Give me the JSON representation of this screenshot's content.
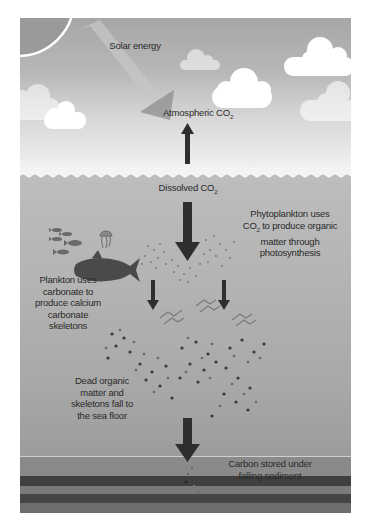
{
  "diagram": {
    "palette": {
      "sky_top": "#a6a6a6",
      "sky_bottom": "#f4f4f4",
      "sea": "#b3b3b3",
      "arrow": "#2e2e2e",
      "cloud": "#ffffff",
      "sediment_dark": "#3c3c3c"
    },
    "labels": {
      "solar_energy": "Solar energy",
      "atmospheric_co2": "Atmospheric CO",
      "atmospheric_co2_sub": "2",
      "dissolved_co2": "Dissolved CO",
      "dissolved_co2_sub": "2",
      "phyto_line1": "Phytoplankton uses",
      "phyto_line2a": "CO",
      "phyto_line2_sub": "2",
      "phyto_line2b": " to produce organic",
      "phyto_line3": "matter through",
      "phyto_line4": "photosynthesis",
      "plankton_line1": "Plankton uses",
      "plankton_line2": "carbonate to",
      "plankton_line3": "produce calcium",
      "plankton_line4": "carbonate",
      "plankton_line5": "skeletons",
      "dead_line1": "Dead organic",
      "dead_line2": "matter and",
      "dead_line3": "skeletons fall to",
      "dead_line4": "the sea floor",
      "carbon_line1": "Carbon stored under",
      "carbon_line2": "falling sediment"
    },
    "elements": [
      "sun",
      "clouds",
      "solar-arrow",
      "co2-up-arrow",
      "water-surface",
      "fish-school",
      "jellyfish",
      "tuna",
      "phytoplankton",
      "zooplankton",
      "sinking-particles",
      "sediment-layers"
    ]
  }
}
